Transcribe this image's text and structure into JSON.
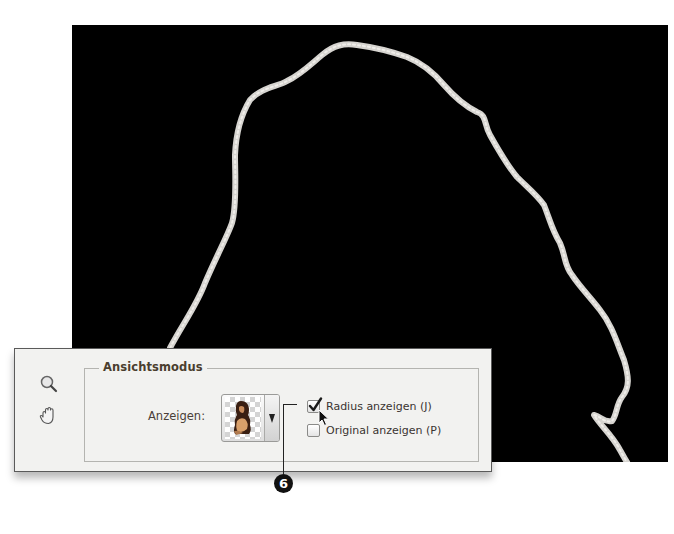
{
  "canvas": {
    "background": "#000000",
    "edge_stroke_color": "#d8d6d2"
  },
  "panel": {
    "tools": [
      {
        "name": "zoom-tool",
        "icon": "magnifier-icon"
      },
      {
        "name": "hand-tool",
        "icon": "hand-icon"
      }
    ],
    "group": {
      "title": "Ansichtsmodus",
      "show_label": "Anzeigen:",
      "view_select": {
        "selected": "thumbnail-preview",
        "thumbnail": "figure-on-transparent-checkerboard"
      },
      "checkboxes": [
        {
          "label": "Radius anzeigen (J)",
          "checked": true
        },
        {
          "label": "Original anzeigen (P)",
          "checked": false
        }
      ]
    }
  },
  "callout": {
    "number": "6"
  }
}
